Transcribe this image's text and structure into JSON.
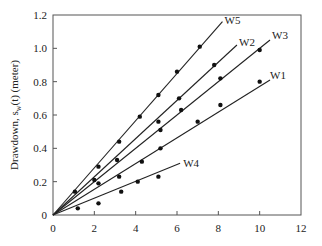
{
  "chart_data": {
    "type": "scatter",
    "title": "",
    "xlabel": "",
    "ylabel": "Drawdown, s_w(t) (meter)",
    "ylabel_parts": {
      "pre": "Drawdown, s",
      "sub": "w",
      "post": "(t) (meter)"
    },
    "xlim": [
      0,
      12
    ],
    "ylim": [
      0,
      1.2
    ],
    "xticks": [
      0,
      2,
      4,
      6,
      8,
      10,
      12
    ],
    "yticks": [
      0,
      0.2,
      0.4,
      0.6,
      0.8,
      1.0,
      1.2
    ],
    "xtick_labels": [
      "0",
      "2",
      "4",
      "6",
      "8",
      "10",
      "12"
    ],
    "ytick_labels": [
      "0",
      "0.2",
      "0.4",
      "0.6",
      "0.8",
      "1.0",
      "1.2"
    ],
    "grid": false,
    "legend": "inline labels at line ends",
    "series": [
      {
        "name": "W5",
        "fit_line": {
          "x": [
            0,
            8.2
          ],
          "y": [
            0,
            1.16
          ]
        },
        "label_pos": [
          8.3,
          1.17
        ],
        "points": [
          [
            1.06,
            0.14
          ],
          [
            2.2,
            0.29
          ],
          [
            3.2,
            0.44
          ],
          [
            4.2,
            0.59
          ],
          [
            5.1,
            0.72
          ],
          [
            6.0,
            0.86
          ],
          [
            7.1,
            1.01
          ]
        ]
      },
      {
        "name": "W2",
        "fit_line": {
          "x": [
            0,
            8.9
          ],
          "y": [
            0,
            1.02
          ]
        },
        "label_pos": [
          9.0,
          1.04
        ],
        "points": [
          [
            2.0,
            0.21
          ],
          [
            3.1,
            0.33
          ],
          [
            5.1,
            0.56
          ],
          [
            6.1,
            0.7
          ],
          [
            7.8,
            0.9
          ]
        ]
      },
      {
        "name": "W3",
        "fit_line": {
          "x": [
            0,
            10.5
          ],
          "y": [
            0,
            1.05
          ]
        },
        "label_pos": [
          10.6,
          1.08
        ],
        "points": [
          [
            2.2,
            0.19
          ],
          [
            4.3,
            0.32
          ],
          [
            5.2,
            0.51
          ],
          [
            6.2,
            0.63
          ],
          [
            8.1,
            0.82
          ],
          [
            10.0,
            0.99
          ]
        ]
      },
      {
        "name": "W1",
        "fit_line": {
          "x": [
            0,
            10.5
          ],
          "y": [
            0,
            0.81
          ]
        },
        "label_pos": [
          10.5,
          0.84
        ],
        "points": [
          [
            3.2,
            0.23
          ],
          [
            4.1,
            0.2
          ],
          [
            5.2,
            0.4
          ],
          [
            7.0,
            0.56
          ],
          [
            8.1,
            0.66
          ],
          [
            10.0,
            0.8
          ]
        ]
      },
      {
        "name": "W4",
        "fit_line": {
          "x": [
            0,
            6.15
          ],
          "y": [
            0,
            0.31
          ]
        },
        "label_pos": [
          6.3,
          0.31
        ],
        "points": [
          [
            1.2,
            0.04
          ],
          [
            2.2,
            0.07
          ],
          [
            3.3,
            0.14
          ],
          [
            5.1,
            0.23
          ]
        ]
      }
    ]
  }
}
